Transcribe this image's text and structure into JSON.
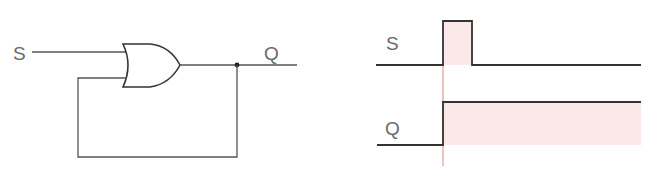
{
  "circuit": {
    "title": "OR gate with feedback (latch)",
    "input_label": "S",
    "output_label": "Q",
    "gate_type": "OR"
  },
  "timing": {
    "signals": [
      {
        "label": "S",
        "waveform": "single pulse high then low"
      },
      {
        "label": "Q",
        "waveform": "goes high at S rising edge and stays high"
      }
    ],
    "marker_color": "#e09a9a",
    "fill_color": "#fbe9e9",
    "line_color": "#333333"
  }
}
